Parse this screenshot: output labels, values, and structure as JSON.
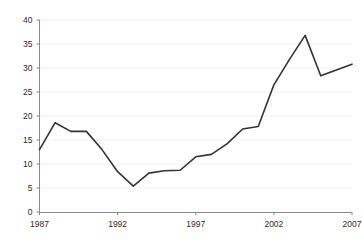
{
  "chart_data": {
    "type": "line",
    "title": "",
    "subtitle": "",
    "xlabel": "",
    "ylabel": "",
    "x": [
      1987,
      1988,
      1989,
      1990,
      1991,
      1992,
      1993,
      1994,
      1995,
      1996,
      1997,
      1998,
      1999,
      2000,
      2001,
      2002,
      2003,
      2004,
      2005,
      2006,
      2007
    ],
    "values": [
      13.0,
      18.6,
      16.8,
      16.8,
      13.0,
      8.4,
      5.4,
      8.1,
      8.6,
      8.7,
      11.5,
      12.0,
      14.2,
      17.3,
      17.8,
      26.5,
      31.8,
      36.8,
      28.4,
      29.6,
      30.8
    ],
    "series": [
      {
        "name": "series-1",
        "values": [
          13.0,
          18.6,
          16.8,
          16.8,
          13.0,
          8.4,
          5.4,
          8.1,
          8.6,
          8.7,
          11.5,
          12.0,
          14.2,
          17.3,
          17.8,
          26.5,
          31.8,
          36.8,
          28.4,
          29.6,
          30.8
        ]
      }
    ],
    "xlim": [
      1987,
      2007
    ],
    "ylim": [
      0,
      40
    ],
    "y_ticks": [
      0,
      5,
      10,
      15,
      20,
      25,
      30,
      35,
      40
    ],
    "y_tick_labels": [
      "0",
      "5",
      "10",
      "15",
      "20",
      "25",
      "30",
      "35",
      "40"
    ],
    "x_ticks": [
      1987,
      1992,
      1997,
      2002,
      2007
    ],
    "x_tick_labels": [
      "1987",
      "1992",
      "1997",
      "2002",
      "2007"
    ],
    "grid": "horizontal-faint",
    "legend": "none",
    "line_color": "#333333",
    "axis_color": "#808080",
    "grid_color": "#f2f2f2",
    "annotations": []
  },
  "axes": {
    "y_labels": [
      "40",
      "35",
      "30",
      "25",
      "20",
      "15",
      "10",
      "5",
      "0"
    ],
    "x_labels": [
      "1987",
      "1992",
      "1997",
      "2002",
      "2007"
    ]
  }
}
